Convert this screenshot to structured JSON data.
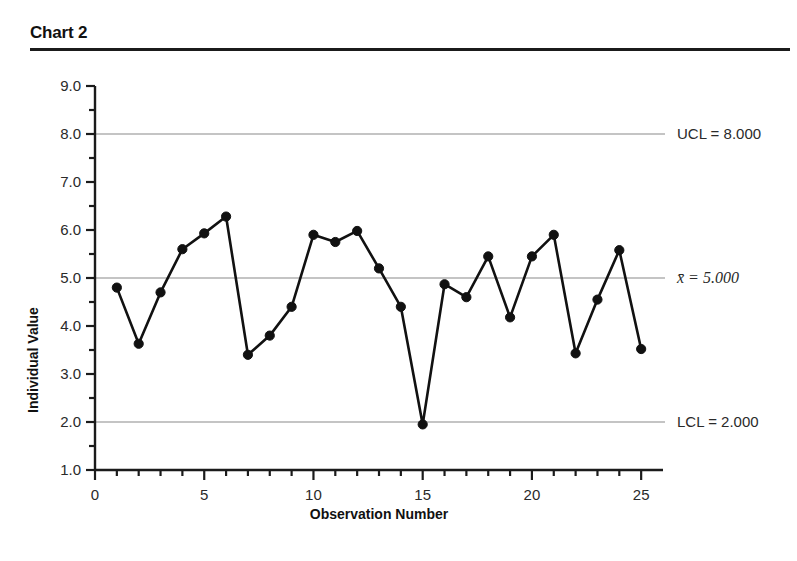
{
  "header": {
    "title": "Chart 2"
  },
  "chart_data": {
    "type": "line",
    "subtype": "individuals-control-chart",
    "title": "Chart 2",
    "xlabel": "Observation Number",
    "ylabel": "Individual Value",
    "x": [
      1,
      2,
      3,
      4,
      5,
      6,
      7,
      8,
      9,
      10,
      11,
      12,
      13,
      14,
      15,
      16,
      17,
      18,
      19,
      20,
      21,
      22,
      23,
      24,
      25
    ],
    "values": [
      4.8,
      3.63,
      4.7,
      5.6,
      5.93,
      6.28,
      3.4,
      3.8,
      4.4,
      5.9,
      5.75,
      5.98,
      5.2,
      4.4,
      1.95,
      4.87,
      4.6,
      5.45,
      4.18,
      5.45,
      5.9,
      3.43,
      4.55,
      5.58,
      3.52
    ],
    "series": [
      {
        "name": "Individual Value",
        "values": [
          4.8,
          3.63,
          4.7,
          5.6,
          5.93,
          6.28,
          3.4,
          3.8,
          4.4,
          5.9,
          5.75,
          5.98,
          5.2,
          4.4,
          1.95,
          4.87,
          4.6,
          5.45,
          4.18,
          5.45,
          5.9,
          3.43,
          4.55,
          5.58,
          3.52
        ],
        "marker": "filled-circle",
        "color": "#111111"
      }
    ],
    "xlim": [
      0,
      26
    ],
    "ylim": [
      1.0,
      9.0
    ],
    "xticks": [
      0,
      5,
      10,
      15,
      20,
      25
    ],
    "xticklabels": [
      "0",
      "5",
      "10",
      "15",
      "20",
      "25"
    ],
    "yticks": [
      1.0,
      2.0,
      3.0,
      4.0,
      5.0,
      6.0,
      7.0,
      8.0,
      9.0
    ],
    "yticklabels": [
      "1.0",
      "2.0",
      "3.0",
      "4.0",
      "5.0",
      "6.0",
      "7.0",
      "8.0",
      "9.0"
    ],
    "yminorticks": [
      1.5,
      2.5,
      3.5,
      4.5,
      5.5,
      6.5,
      7.5,
      8.5
    ],
    "grid": false,
    "legend": "none",
    "control_limits": [
      {
        "name": "UCL",
        "label": "UCL = 8.000",
        "value": 8.0,
        "color": "#b0b0b0"
      },
      {
        "name": "CL",
        "label": "x̄ = 5.000",
        "value": 5.0,
        "color": "#b0b0b0",
        "italic": true
      },
      {
        "name": "LCL",
        "label": "LCL = 2.000",
        "value": 2.0,
        "color": "#b0b0b0"
      }
    ],
    "annotations": [
      {
        "text": "UCL = 8.000",
        "at_y": 8.0
      },
      {
        "text": "x̄ = 5.000",
        "at_y": 5.0
      },
      {
        "text": "LCL = 2.000",
        "at_y": 2.0
      }
    ]
  },
  "colors": {
    "line": "#111111",
    "marker": "#111111",
    "limit_line": "#b3b3b3",
    "axis": "#1b1b1b",
    "rule": "#1b1b1b",
    "background": "#ffffff"
  }
}
